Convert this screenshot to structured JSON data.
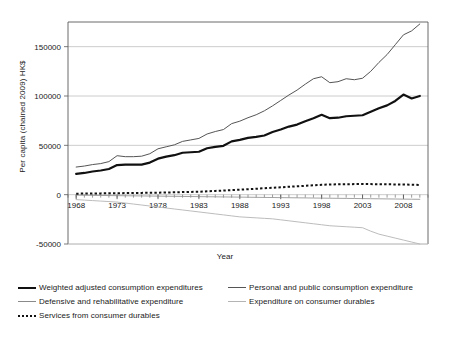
{
  "chart_data": {
    "type": "line",
    "title": "",
    "xlabel": "Year",
    "ylabel": "Per capita (chained 2009) HK$",
    "xlim": [
      1967,
      2011
    ],
    "ylim": [
      -50000,
      175000
    ],
    "yticks": [
      -50000,
      0,
      50000,
      100000,
      150000
    ],
    "ytick_labels": [
      "-50000",
      "0",
      "50000",
      "100000",
      "150000"
    ],
    "xticks": [
      1968,
      1973,
      1978,
      1983,
      1988,
      1993,
      1998,
      2003,
      2008
    ],
    "xtick_labels": [
      "1968",
      "1973",
      "1978",
      "1983",
      "1988",
      "1993",
      "1998",
      "2003",
      "2008"
    ],
    "x_minor_tick_interval": 1,
    "grid": "horizontal",
    "legend_position": "bottom",
    "x": [
      1968,
      1969,
      1970,
      1971,
      1972,
      1973,
      1974,
      1975,
      1976,
      1977,
      1978,
      1979,
      1980,
      1981,
      1982,
      1983,
      1984,
      1985,
      1986,
      1987,
      1988,
      1989,
      1990,
      1991,
      1992,
      1993,
      1994,
      1995,
      1996,
      1997,
      1998,
      1999,
      2000,
      2001,
      2002,
      2003,
      2004,
      2005,
      2006,
      2007,
      2008,
      2009,
      2010
    ],
    "series": [
      {
        "name": "Weighted adjusted consumption expenditures",
        "style": "thick-solid",
        "color": "#111111",
        "width": 2.2,
        "values": [
          21000,
          22000,
          23500,
          24500,
          26000,
          30000,
          30500,
          30500,
          30500,
          32500,
          36500,
          38500,
          40000,
          42500,
          43000,
          43500,
          47000,
          48500,
          49500,
          54000,
          55500,
          57500,
          58500,
          60000,
          63500,
          66000,
          69000,
          71000,
          74500,
          77500,
          81000,
          77500,
          78000,
          79500,
          80000,
          80500,
          84000,
          87500,
          90500,
          95000,
          101500,
          97500,
          100000
        ]
      },
      {
        "name": "Personal and public consumption expenditure",
        "style": "thin-solid",
        "color": "#555555",
        "width": 1.0,
        "values": [
          28000,
          29000,
          30500,
          31500,
          33500,
          39500,
          38500,
          38500,
          39000,
          41500,
          46500,
          48500,
          50500,
          54000,
          55500,
          57000,
          61500,
          64000,
          66000,
          72000,
          74500,
          78000,
          81000,
          85000,
          90000,
          95500,
          101000,
          106000,
          112000,
          117500,
          119500,
          113500,
          114500,
          117500,
          116500,
          118000,
          125000,
          134000,
          142000,
          152000,
          162000,
          166000,
          173000
        ]
      },
      {
        "name": "Defensive and rehabilitative expenditure",
        "style": "thin-solid",
        "color": "#8a8a8a",
        "width": 0.8,
        "values": [
          -500,
          -600,
          -700,
          -800,
          -900,
          -1000,
          -1100,
          -1200,
          -1300,
          -1400,
          -1500,
          -1600,
          -1700,
          -1800,
          -1900,
          -2000,
          -2100,
          -2200,
          -2300,
          -2400,
          -2500,
          -2600,
          -2700,
          -2800,
          -2900,
          -3000,
          -3100,
          -3200,
          -3300,
          -3400,
          -3500,
          -3600,
          -3700,
          -3800,
          -3900,
          -4000,
          -4100,
          -4200,
          -4300,
          -4400,
          -4500,
          -4600,
          -4700
        ]
      },
      {
        "name": "Expenditure on consumer durables",
        "style": "thin-solid",
        "color": "#b4b4b4",
        "width": 0.9,
        "values": [
          -5000,
          -5500,
          -6000,
          -6500,
          -7000,
          -7500,
          -8500,
          -9500,
          -10500,
          -11500,
          -12500,
          -13500,
          -14500,
          -15500,
          -16500,
          -17500,
          -18500,
          -19500,
          -20500,
          -21500,
          -22500,
          -23000,
          -23500,
          -24000,
          -24500,
          -25500,
          -26500,
          -27500,
          -28500,
          -29500,
          -30500,
          -31500,
          -32000,
          -32500,
          -33000,
          -33500,
          -37000,
          -40000,
          -42000,
          -44000,
          -46000,
          -48000,
          -50000
        ]
      },
      {
        "name": "Services from consumer durables",
        "style": "dotted",
        "color": "#111111",
        "width": 2.0,
        "values": [
          1000,
          1100,
          1200,
          1300,
          1400,
          1500,
          1600,
          1700,
          1800,
          1900,
          2000,
          2200,
          2400,
          2600,
          2800,
          3000,
          3400,
          3800,
          4200,
          4600,
          5000,
          5500,
          6000,
          6500,
          7000,
          7500,
          8000,
          8500,
          9000,
          9500,
          10000,
          10300,
          10500,
          10600,
          10700,
          10800,
          10700,
          10600,
          10500,
          10400,
          10300,
          10100,
          9800
        ]
      }
    ]
  },
  "legend": {
    "rows": [
      [
        {
          "label": "Weighted adjusted consumption expenditures",
          "style": "thick-solid",
          "color": "#111111"
        },
        {
          "label": "Personal and public consumption expenditure",
          "style": "thin-solid",
          "color": "#555555"
        }
      ],
      [
        {
          "label": "Defensive and rehabilitative expenditure",
          "style": "thin-solid",
          "color": "#8a8a8a"
        },
        {
          "label": "Expenditure on consumer durables",
          "style": "thin-solid",
          "color": "#b4b4b4"
        }
      ],
      [
        {
          "label": "Services from consumer durables",
          "style": "dotted",
          "color": "#111111"
        }
      ]
    ]
  },
  "colors": {
    "axis": "#595959",
    "grid": "#bfbfbf",
    "text": "#1a1a1a",
    "background": "#ffffff"
  }
}
